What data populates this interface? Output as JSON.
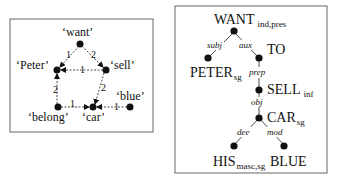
{
  "semantic_graph": {
    "nodes": [
      {
        "id": "want",
        "label": "‘want’"
      },
      {
        "id": "peter",
        "label": "‘Peter’"
      },
      {
        "id": "sell",
        "label": "‘sell’"
      },
      {
        "id": "belong",
        "label": "‘belong’"
      },
      {
        "id": "car",
        "label": "‘car’"
      },
      {
        "id": "blue",
        "label": "‘blue’"
      }
    ],
    "edges": [
      {
        "from": "want",
        "to": "peter",
        "label": "1"
      },
      {
        "from": "want",
        "to": "sell",
        "label": "2"
      },
      {
        "from": "sell",
        "to": "peter",
        "label": "1"
      },
      {
        "from": "sell",
        "to": "car",
        "label": "2"
      },
      {
        "from": "belong",
        "to": "peter",
        "label": "2"
      },
      {
        "from": "belong",
        "to": "car",
        "label": "1"
      },
      {
        "from": "blue",
        "to": "car",
        "label": "1"
      }
    ]
  },
  "syntactic_tree": {
    "nodes": [
      {
        "id": "want",
        "word": "WANT",
        "sub": "ind,pres"
      },
      {
        "id": "peter",
        "word": "PETER",
        "sub": "sg"
      },
      {
        "id": "to",
        "word": "TO",
        "sub": ""
      },
      {
        "id": "sell",
        "word": "SELL",
        "sub": "inf"
      },
      {
        "id": "car",
        "word": "CAR",
        "sub": "sg"
      },
      {
        "id": "his",
        "word": "HIS",
        "sub": "masc,sg"
      },
      {
        "id": "blue",
        "word": "BLUE",
        "sub": ""
      }
    ],
    "edges": [
      {
        "from": "want",
        "to": "peter",
        "label": "subj"
      },
      {
        "from": "want",
        "to": "to",
        "label": "aux"
      },
      {
        "from": "to",
        "to": "sell",
        "label": "prep"
      },
      {
        "from": "sell",
        "to": "car",
        "label": "obj"
      },
      {
        "from": "car",
        "to": "his",
        "label": "dee"
      },
      {
        "from": "car",
        "to": "blue",
        "label": "mod"
      }
    ]
  }
}
